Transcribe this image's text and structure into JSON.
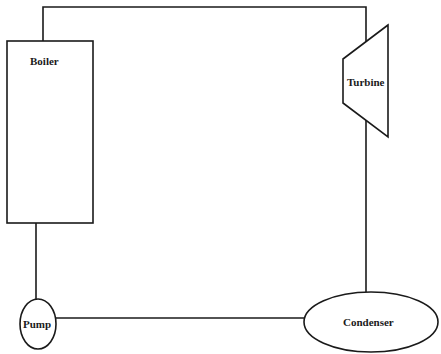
{
  "diagram": {
    "type": "rankine-cycle-schematic",
    "components": {
      "boiler": {
        "label": "Boiler"
      },
      "turbine": {
        "label": "Turbine"
      },
      "condenser": {
        "label": "Condenser"
      },
      "pump": {
        "label": "Pump"
      }
    },
    "connections": [
      {
        "from": "boiler",
        "to": "turbine"
      },
      {
        "from": "turbine",
        "to": "condenser"
      },
      {
        "from": "condenser",
        "to": "pump"
      },
      {
        "from": "pump",
        "to": "boiler"
      }
    ],
    "colors": {
      "stroke": "#1a1a1a",
      "background": "#ffffff"
    }
  }
}
